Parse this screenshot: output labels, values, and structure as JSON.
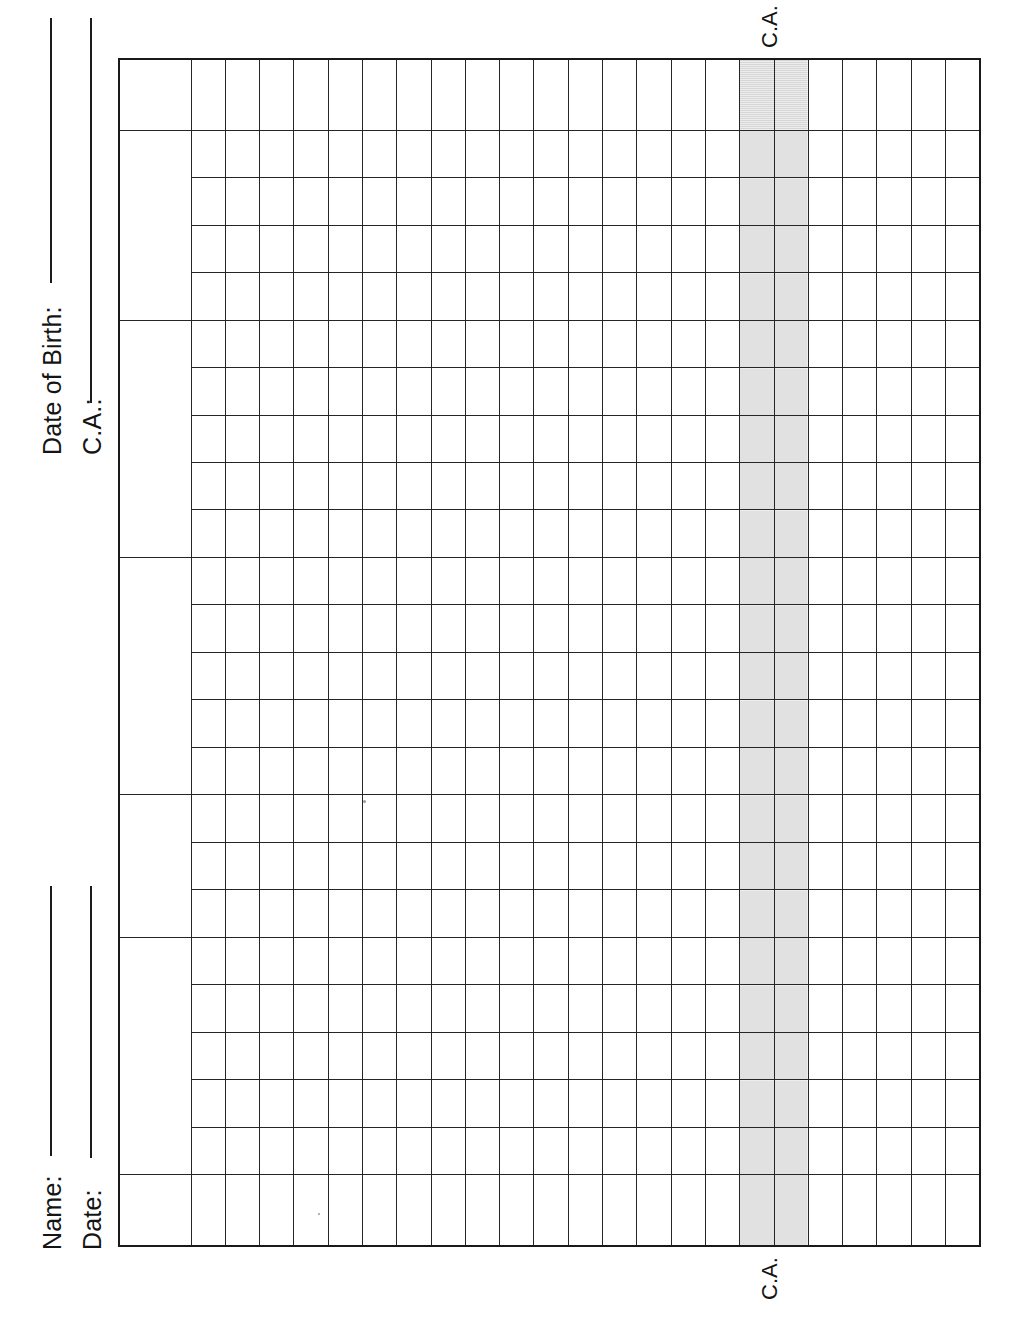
{
  "form": {
    "title": "Developmental Profile Grid Worksheet",
    "top_fields": [
      {
        "label": "Date of Birth:",
        "value": ""
      },
      {
        "label": "C.A.:",
        "value": ""
      }
    ],
    "bottom_fields": [
      {
        "label": "Name:",
        "value": ""
      },
      {
        "label": "Date:",
        "value": ""
      }
    ],
    "column_markers": {
      "top": "C.A.",
      "bottom": "C.A."
    }
  },
  "grid": {
    "label_column_header": "",
    "data_column_count": 23,
    "shaded_column_indices": [
      17,
      18
    ],
    "shaded_color": "#c7c7c7",
    "line_color": "#252525",
    "blocks": [
      {
        "name": "block-1",
        "rows": 1,
        "label": ""
      },
      {
        "name": "block-2",
        "rows": 4,
        "label": ""
      },
      {
        "name": "block-3",
        "rows": 5,
        "label": ""
      },
      {
        "name": "block-4",
        "rows": 5,
        "label": ""
      },
      {
        "name": "block-5",
        "rows": 3,
        "label": ""
      },
      {
        "name": "block-6",
        "rows": 5,
        "label": ""
      },
      {
        "name": "block-7",
        "rows": 1,
        "label": ""
      }
    ]
  }
}
